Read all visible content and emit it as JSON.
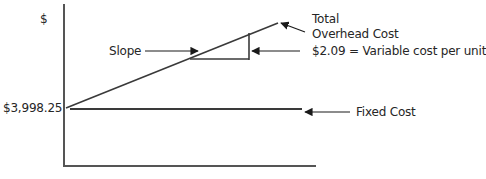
{
  "diagram": {
    "y_axis_label": "$",
    "y_intercept_label": "$3,998.25",
    "labels": {
      "total_line1": "Total",
      "total_line2": "Overhead Cost",
      "variable_cost": "$2.09 = Variable cost per unit",
      "slope": "Slope",
      "fixed_cost": "Fixed Cost"
    },
    "colors": {
      "line": "#3a3a3a",
      "text": "#262626"
    }
  }
}
